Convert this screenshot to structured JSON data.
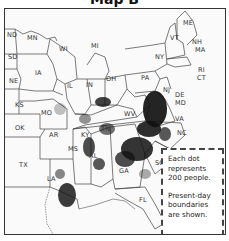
{
  "map": {
    "title": "Map B",
    "type": "dot-density population map",
    "states": {
      "ND": "ND",
      "MN": "MN",
      "SD": "SD",
      "WI": "WI",
      "MI": "MI",
      "IA": "IA",
      "NE": "NE",
      "IL": "IL",
      "IN": "IN",
      "OH": "OH",
      "KS": "KS",
      "MO": "MO",
      "OK": "OK",
      "AR": "AR",
      "TX": "TX",
      "LA": "LA",
      "MS": "MS",
      "AL": "AL",
      "TN": "TN",
      "KY": "KY",
      "GA": "GA",
      "FL": "FL",
      "SC": "SC",
      "NC": "NC",
      "VA": "VA",
      "WV": "WV",
      "MD": "MD",
      "DE": "DE",
      "NJ": "NJ",
      "PA": "PA",
      "NY": "NY",
      "CT": "CT",
      "RI": "RI",
      "MA": "MA",
      "NH": "NH",
      "VT": "VT",
      "ME": "ME"
    },
    "legend": {
      "line1": "Each dot represents 200 people.",
      "line2": "Present-day boundaries are shown."
    },
    "colors": {
      "border": "#333333",
      "dots": "#111111",
      "land": "#fafafa"
    }
  }
}
